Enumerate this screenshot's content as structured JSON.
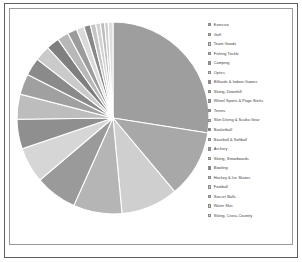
{
  "figure": {
    "background_color": "#ffffff",
    "outer_frame_color": "#5e5e5e",
    "inner_frame_color": "#9a9a9a",
    "wedge_edge_color": "#ffffff"
  },
  "legend": {
    "position": "right",
    "marker": "square-swatch"
  },
  "chart_data": {
    "type": "pie",
    "title": "",
    "subtitle": "",
    "xlabel": "",
    "ylabel": "",
    "grid": false,
    "legend_position": "right",
    "start_angle": 90,
    "direction": "clockwise",
    "labels": [
      "Exercise",
      "Golf",
      "Team Goods",
      "Fishing Tackle",
      "Camping",
      "Optics",
      "Billiards & Indoor Games",
      "Skiing, Downhill",
      "Wheel Sports & Pogo Sticks",
      "Tennis",
      "Skin Diving & Scuba Gear",
      "Basketball",
      "Baseball & Softball",
      "Archery",
      "Skiing, Snowboards",
      "Bowling",
      "Hockey & Ice Skates",
      "Football",
      "Soccer Balls",
      "Water Skis",
      "Skiing, Cross-Country"
    ],
    "values": [
      27.5,
      11.4,
      9.6,
      8.2,
      7.1,
      6.0,
      5.0,
      4.2,
      3.5,
      3.0,
      2.6,
      2.2,
      1.9,
      1.6,
      1.3,
      1.1,
      0.9,
      0.8,
      0.7,
      0.6,
      0.8
    ],
    "colors": [
      "#9e9e9e",
      "#a8a8a8",
      "#cfcfcf",
      "#b5b5b5",
      "#9a9a9a",
      "#d6d6d6",
      "#8f8f8f",
      "#bdbdbd",
      "#a0a0a0",
      "#8a8a8a",
      "#cacaca",
      "#7f7f7f",
      "#b8b8b8",
      "#9c9c9c",
      "#dadada",
      "#888888",
      "#c4c4c4",
      "#d2d2d2",
      "#bcbcbc",
      "#cdcdcd",
      "#dedede"
    ]
  }
}
